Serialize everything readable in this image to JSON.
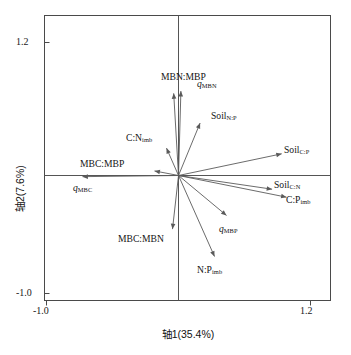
{
  "figure": {
    "kind": "pca-biplot",
    "background_color": "#ffffff",
    "frame_color": "#4a4a4a",
    "vector_color": "#5a5a5a"
  },
  "axes": {
    "x_title": "轴1(35.4%)",
    "y_title": "轴2(7.6%)",
    "x_ticks": [
      "-1.0",
      "1.2"
    ],
    "y_ticks": [
      "1.2",
      "-1.0"
    ],
    "x_tick_min": "-1.0",
    "x_tick_max": "1.2",
    "y_tick_min": "-1.0",
    "y_tick_max": "1.2"
  },
  "chart_data": {
    "type": "scatter",
    "title": "",
    "xlabel": "轴1(35.4%)",
    "ylabel": "轴2(7.6%)",
    "xlim": [
      -1.0,
      1.2
    ],
    "ylim": [
      -1.0,
      1.2
    ],
    "grid": false,
    "legend": "none",
    "axis1_variance_percent": 35.4,
    "axis2_variance_percent": 7.6,
    "origin": [
      0,
      0
    ],
    "vectors": [
      {
        "name": "MBN:MBP",
        "label_main": "MBN:MBP",
        "label_sub": "",
        "italic_head": false,
        "x": -0.04,
        "y": 0.72,
        "label_x": 0.04,
        "label_y": 0.86
      },
      {
        "name": "q_MBN",
        "label_main": "q",
        "label_sub": "MBN",
        "italic_head": true,
        "x": 0.02,
        "y": 0.74,
        "label_x": 0.24,
        "label_y": 0.8
      },
      {
        "name": "Soil_N:P",
        "label_main": "Soil",
        "label_sub": "N:P",
        "italic_head": false,
        "x": 0.18,
        "y": 0.46,
        "label_x": 0.38,
        "label_y": 0.52
      },
      {
        "name": "C:N_imb",
        "label_main": "C:N",
        "label_sub": "imb",
        "italic_head": false,
        "x": -0.1,
        "y": 0.24,
        "label_x": -0.33,
        "label_y": 0.32
      },
      {
        "name": "MBC:MBP",
        "label_main": "MBC:MBP",
        "label_sub": "",
        "italic_head": false,
        "x": -0.2,
        "y": 0.04,
        "label_x": -0.64,
        "label_y": 0.1
      },
      {
        "name": "q_MBC",
        "label_main": "q",
        "label_sub": "MBC",
        "italic_head": true,
        "x": -0.8,
        "y": -0.01,
        "label_x": -0.8,
        "label_y": -0.11
      },
      {
        "name": "Soil_C:P",
        "label_main": "Soil",
        "label_sub": "C:P",
        "italic_head": false,
        "x": 0.86,
        "y": 0.19,
        "label_x": 0.98,
        "label_y": 0.22
      },
      {
        "name": "Soil_C:N",
        "label_main": "Soil",
        "label_sub": "C:N",
        "italic_head": false,
        "x": 0.78,
        "y": -0.12,
        "label_x": 0.9,
        "label_y": -0.09
      },
      {
        "name": "C:P_imb",
        "label_main": "C:P",
        "label_sub": "imb",
        "italic_head": false,
        "x": 0.9,
        "y": -0.19,
        "label_x": 1.0,
        "label_y": -0.22
      },
      {
        "name": "q_MBP",
        "label_main": "q",
        "label_sub": "MBP",
        "italic_head": true,
        "x": 0.4,
        "y": -0.35,
        "label_x": 0.42,
        "label_y": -0.47
      },
      {
        "name": "MBC:MBN",
        "label_main": "MBC:MBN",
        "label_sub": "",
        "italic_head": false,
        "x": -0.05,
        "y": -0.47,
        "label_x": -0.31,
        "label_y": -0.56
      },
      {
        "name": "N:P_imb",
        "label_main": "N:P",
        "label_sub": "imb",
        "italic_head": false,
        "x": 0.3,
        "y": -0.71,
        "label_x": 0.26,
        "label_y": -0.83
      }
    ]
  }
}
